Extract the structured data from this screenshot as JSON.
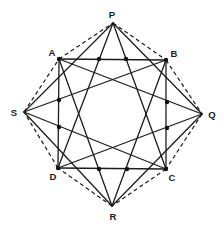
{
  "diagram": {
    "vertices": {
      "P": {
        "label": "P",
        "x": 113,
        "y": 23,
        "lx": 112,
        "ly": 14
      },
      "A": {
        "label": "A",
        "x": 59,
        "y": 59,
        "lx": 52,
        "ly": 52
      },
      "B": {
        "label": "B",
        "x": 166,
        "y": 60,
        "lx": 174,
        "ly": 53
      },
      "S": {
        "label": "S",
        "x": 24,
        "y": 112,
        "lx": 14,
        "ly": 112
      },
      "Q": {
        "label": "Q",
        "x": 202,
        "y": 114,
        "lx": 212,
        "ly": 114
      },
      "D": {
        "label": "D",
        "x": 58,
        "y": 168,
        "lx": 53,
        "ly": 176
      },
      "C": {
        "label": "C",
        "x": 166,
        "y": 169,
        "lx": 172,
        "ly": 177
      },
      "R": {
        "label": "R",
        "x": 112,
        "y": 206,
        "lx": 113,
        "ly": 216
      }
    },
    "solid_segments": [
      [
        "A",
        "B"
      ],
      [
        "B",
        "C"
      ],
      [
        "C",
        "D"
      ],
      [
        "D",
        "A"
      ],
      [
        "P",
        "Q"
      ],
      [
        "Q",
        "R"
      ],
      [
        "R",
        "S"
      ],
      [
        "S",
        "P"
      ],
      [
        "P",
        "D"
      ],
      [
        "P",
        "C"
      ],
      [
        "Q",
        "A"
      ],
      [
        "Q",
        "D"
      ],
      [
        "R",
        "A"
      ],
      [
        "R",
        "B"
      ],
      [
        "S",
        "B"
      ],
      [
        "S",
        "C"
      ]
    ],
    "dashed_segments": [
      [
        "P",
        "B"
      ],
      [
        "B",
        "Q"
      ],
      [
        "Q",
        "C"
      ],
      [
        "C",
        "R"
      ],
      [
        "R",
        "D"
      ],
      [
        "D",
        "S"
      ],
      [
        "S",
        "A"
      ],
      [
        "A",
        "P"
      ]
    ],
    "dots": [
      {
        "x": 99,
        "y": 59
      },
      {
        "x": 126,
        "y": 59
      },
      {
        "x": 59,
        "y": 100
      },
      {
        "x": 59,
        "y": 127
      },
      {
        "x": 167,
        "y": 102
      },
      {
        "x": 167,
        "y": 128
      },
      {
        "x": 99,
        "y": 169
      },
      {
        "x": 127,
        "y": 169
      },
      {
        "x": 59,
        "y": 59
      },
      {
        "x": 166,
        "y": 60
      },
      {
        "x": 58,
        "y": 168
      },
      {
        "x": 166,
        "y": 169
      }
    ],
    "labels": [
      "P",
      "A",
      "B",
      "S",
      "Q",
      "D",
      "C",
      "R"
    ]
  }
}
